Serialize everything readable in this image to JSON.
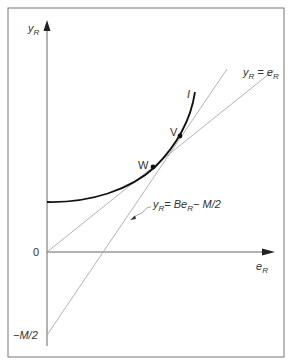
{
  "diagram": {
    "y_axis_label": {
      "main": "y",
      "sub": "R"
    },
    "x_axis_label": {
      "main": "e",
      "sub": "R"
    },
    "origin_label": "0",
    "intercept_label": "−M/2",
    "curve_label": "I",
    "points": [
      {
        "name": "W",
        "x": 153,
        "y": 167
      },
      {
        "name": "V",
        "x": 180,
        "y": 136
      }
    ],
    "lines": [
      {
        "name": "identity-line",
        "label": {
          "lhs_main": "y",
          "lhs_sub": "R",
          "eq": " = ",
          "rhs_main": "e",
          "rhs_sub": "R",
          "rhs_tail": ""
        }
      },
      {
        "name": "budget-line",
        "label": {
          "lhs_main": "y",
          "lhs_sub": "R",
          "eq": "= ",
          "rhs_main": "Be",
          "rhs_sub": "R",
          "rhs_tail": "− M/2"
        }
      }
    ],
    "colors": {
      "frame": "#777777",
      "axes": "#555555",
      "curve": "#111111",
      "thin_lines": "#aaaaaa",
      "text": "#333333"
    }
  }
}
